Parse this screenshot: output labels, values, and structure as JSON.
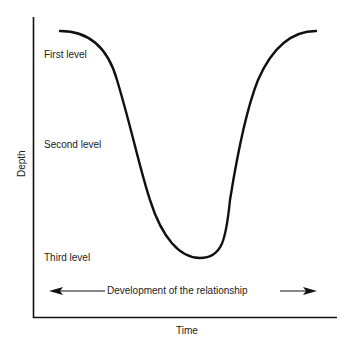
{
  "diagram": {
    "axes": {
      "y_label": "Depth",
      "x_label": "Time"
    },
    "levels": [
      {
        "label": "First level"
      },
      {
        "label": "Second level"
      },
      {
        "label": "Third level"
      }
    ],
    "arrow": {
      "label": "Development of the relationship",
      "direction": "bidirectional"
    },
    "curve": {
      "description": "U-shaped curve: starts high at first level, descends through second level to a minimum at third level, then rises back to first level",
      "shape": "U"
    },
    "colors": {
      "line": "#111111",
      "text": "#222222",
      "background": "#ffffff"
    }
  }
}
